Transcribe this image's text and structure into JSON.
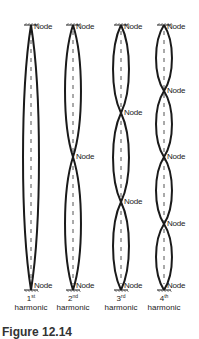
{
  "diagram": {
    "node_label": "Node",
    "harmonics": [
      {
        "number": "1",
        "suffix": "st",
        "label": "harmonic",
        "center_x": 31,
        "nodes_y": [
          25,
          290
        ]
      },
      {
        "number": "2",
        "suffix": "nd",
        "label": "harmonic",
        "center_x": 73,
        "nodes_y": [
          25,
          157,
          290
        ]
      },
      {
        "number": "3",
        "suffix": "rd",
        "label": "harmonic",
        "center_x": 121,
        "nodes_y": [
          25,
          113,
          202,
          290
        ]
      },
      {
        "number": "4",
        "suffix": "th",
        "label": "harmonic",
        "center_x": 164,
        "nodes_y": [
          25,
          91,
          157,
          224,
          290
        ]
      }
    ],
    "caption": "Figure 12.14"
  },
  "colors": {
    "string": "#1a1a1a",
    "rest_line": "#555555",
    "text": "#222222"
  }
}
